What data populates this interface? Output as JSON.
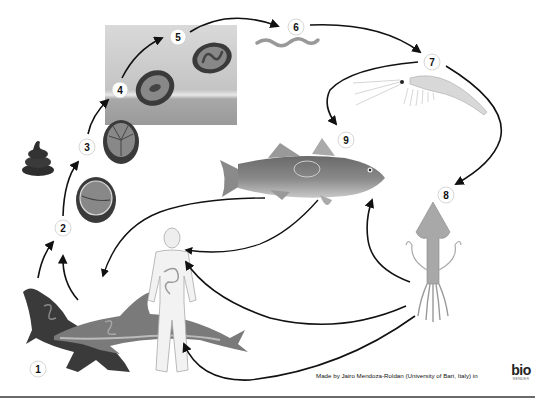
{
  "diagram": {
    "steps": [
      {
        "num": "1",
        "label": "Definitive hosts (marine mammals)",
        "x": 38,
        "y": 369
      },
      {
        "num": "2",
        "label": "Eggs in feces",
        "x": 63,
        "y": 228
      },
      {
        "num": "3",
        "label": "Embryonated egg",
        "x": 87,
        "y": 147
      },
      {
        "num": "4",
        "label": "Larva develops in egg (water)",
        "x": 120,
        "y": 90
      },
      {
        "num": "5",
        "label": "Larva hatches",
        "x": 178,
        "y": 37
      },
      {
        "num": "6",
        "label": "Free-swimming larva",
        "x": 296,
        "y": 27
      },
      {
        "num": "7",
        "label": "Crustacean intermediate host",
        "x": 432,
        "y": 62
      },
      {
        "num": "8",
        "label": "Squid paratenic host",
        "x": 446,
        "y": 195
      },
      {
        "num": "9",
        "label": "Fish paratenic host",
        "x": 346,
        "y": 140
      }
    ],
    "organisms": [
      "sea-lion",
      "dolphin",
      "human",
      "feces",
      "egg-2-cell",
      "egg-4-cell",
      "egg-larva",
      "egg-coiled-larva",
      "larva-worm",
      "krill",
      "fish",
      "squid"
    ]
  },
  "footer": {
    "credit": "Made by Jairo Mendoza-Roldan (University of Bari, Italy) in",
    "logo_main": "bio",
    "logo_sub": "RENDER"
  },
  "colors": {
    "arrow": "#111111",
    "panel_top": "#d4d4d4",
    "panel_bottom": "#9a9a9a",
    "egg_shell": "#3a3a3a",
    "egg_inner": "#8a8a8a"
  }
}
